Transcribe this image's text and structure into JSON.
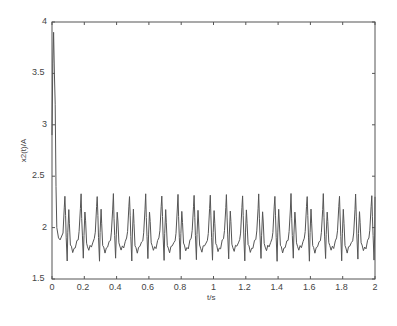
{
  "chart_data": {
    "type": "line",
    "title": "",
    "xlabel": "t/s",
    "ylabel": "x2(t)/A",
    "xlim": [
      0,
      2
    ],
    "ylim": [
      1.5,
      4
    ],
    "xticks": [
      "0",
      "0.2",
      "0.4",
      "0.6",
      "0.8",
      "1",
      "1.2",
      "1.4",
      "1.6",
      "1.8",
      "2"
    ],
    "yticks": [
      "1.5",
      "2",
      "2.5",
      "3",
      "3.5",
      "4"
    ],
    "grid": false,
    "legend": null,
    "series": [
      {
        "name": "x2(t)",
        "description": "Initial transient spike to ~3.9 near t=0.01, decaying to ~1.9 by t=0.04, then steady periodic oscillation with period ~0.1 s: tall peak ~2.33, secondary peak ~2.15, troughs ~1.8, sharp dips ~1.7",
        "x": [
          0,
          0.005,
          0.01,
          0.015,
          0.02,
          0.025,
          0.03,
          0.04,
          0.05,
          0.06,
          0.08,
          0.1,
          0.12,
          0.14,
          0.16,
          0.18,
          0.2
        ],
        "y": [
          2.9,
          3.6,
          3.9,
          3.5,
          3.2,
          2.4,
          2.0,
          1.9,
          1.88,
          2.1,
          2.42,
          1.7,
          2.18,
          1.82,
          1.8,
          2.33,
          1.7
        ],
        "steady_state": {
          "period": 0.1,
          "peak_high": 2.33,
          "peak_low": 2.15,
          "trough": 1.8,
          "dip": 1.7
        }
      }
    ]
  },
  "axes": {
    "xlabel": "t/s",
    "ylabel": "x2(t)/A"
  }
}
